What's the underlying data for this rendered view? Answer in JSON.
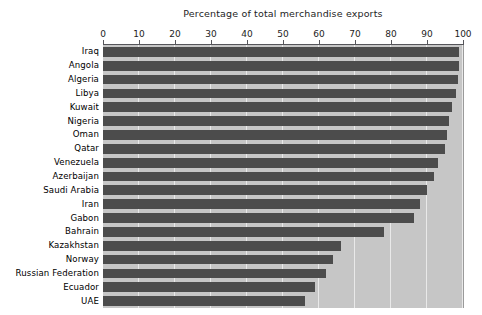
{
  "chart_data": {
    "type": "bar",
    "orientation": "horizontal",
    "title": "Percentage of total merchandise exports",
    "subtitle": "",
    "xlabel": "",
    "ylabel": "",
    "xlim": [
      0,
      100
    ],
    "ylim": null,
    "grid": true,
    "legend": null,
    "legend_position": "none",
    "xticks": [
      0,
      10,
      20,
      30,
      40,
      50,
      60,
      70,
      80,
      90,
      100
    ],
    "xtick_labels": [
      "0",
      "10",
      "20",
      "30",
      "40",
      "50",
      "60",
      "70",
      "80",
      "90",
      "100"
    ],
    "axis_position": "top",
    "categories": [
      "Iraq",
      "Angola",
      "Algeria",
      "Libya",
      "Kuwait",
      "Nigeria",
      "Oman",
      "Qatar",
      "Venezuela",
      "Azerbaijan",
      "Saudi Arabia",
      "Iran",
      "Gabon",
      "Bahrain",
      "Kazakhstan",
      "Norway",
      "Russian Federation",
      "Ecuador",
      "UAE"
    ],
    "values": [
      99,
      99,
      98.5,
      98,
      97,
      96,
      95.5,
      95,
      93,
      92,
      90,
      88,
      86.5,
      78,
      66,
      64,
      62,
      59,
      56
    ],
    "series": [
      {
        "name": "Percentage of total merchandise exports",
        "values": [
          99,
          99,
          98.5,
          98,
          97,
          96,
          95.5,
          95,
          93,
          92,
          90,
          88,
          86.5,
          78,
          66,
          64,
          62,
          59,
          56
        ]
      }
    ]
  },
  "colors": {
    "bar": "#4c4c4c",
    "plot_background": "#c6c6c6",
    "gridline": "#e9e9e9",
    "axis": "#55555a",
    "page_background": "#ffffff",
    "text": "#000000"
  }
}
